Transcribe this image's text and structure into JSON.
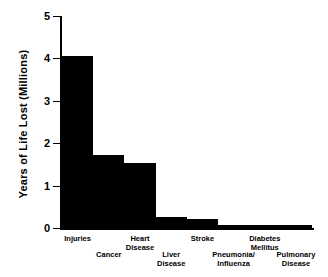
{
  "chart_data": {
    "type": "bar",
    "title": "",
    "xlabel": "",
    "ylabel": "Years of Life Lost (Millions)",
    "ylim": [
      0,
      5
    ],
    "yticks": [
      "0",
      "1",
      "2",
      "3",
      "4",
      "5"
    ],
    "grid": false,
    "legend": "none",
    "bar_color": "#000000",
    "categories": [
      "Injuries",
      "Cancer",
      "Heart Disease",
      "Liver Disease",
      "Stroke",
      "Pneumonia/ Influenza",
      "Diabetes Mellitus",
      "Pulmonary Disease"
    ],
    "category_lines": [
      "Injuries",
      "Cancer",
      "Heart\nDisease",
      "Liver\nDisease",
      "Stroke",
      "Pneumonia/\nInfluenza",
      "Diabetes\nMellitus",
      "Pulmonary\nDisease"
    ],
    "values": [
      4.05,
      1.72,
      1.53,
      0.27,
      0.22,
      0.08,
      0.08,
      0.07
    ]
  }
}
